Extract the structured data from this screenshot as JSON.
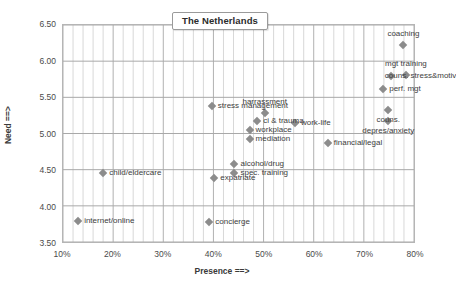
{
  "chart_data": {
    "type": "scatter",
    "title": "The Netherlands",
    "xlabel": "Presence ==>",
    "ylabel": "Need ==>",
    "xlim": [
      10,
      80
    ],
    "ylim": [
      3.5,
      6.5
    ],
    "xticks": [
      "10%",
      "20%",
      "30%",
      "40%",
      "50%",
      "60%",
      "70%",
      "80%"
    ],
    "xtick_values": [
      10,
      20,
      30,
      40,
      50,
      60,
      70,
      80
    ],
    "yticks": [
      "3.50",
      "4.00",
      "4.50",
      "5.00",
      "5.50",
      "6.00",
      "6.50"
    ],
    "ytick_values": [
      3.5,
      4.0,
      4.5,
      5.0,
      5.5,
      6.0,
      6.5
    ],
    "grid": true,
    "legend": "none",
    "marker": "diamond",
    "marker_color": "#8c8c8c",
    "points": [
      {
        "label": "coaching",
        "x": 77.5,
        "y": 6.23,
        "pos": "above"
      },
      {
        "label": "mgt training",
        "x": 78.0,
        "y": 5.82,
        "pos": "above"
      },
      {
        "label": "couns. stress&motiv",
        "x": 75.0,
        "y": 5.8,
        "pos": "left"
      },
      {
        "label": "perf. mgt",
        "x": 73.5,
        "y": 5.62,
        "pos": "right"
      },
      {
        "label": "couns.",
        "x": 74.5,
        "y": 5.33,
        "pos": "below"
      },
      {
        "label": "depres/anxiety",
        "x": 74.5,
        "y": 5.18,
        "pos": "below"
      },
      {
        "label": "harrassment",
        "x": 50.0,
        "y": 5.3,
        "pos": "above"
      },
      {
        "label": "stress management",
        "x": 39.5,
        "y": 5.39,
        "pos": "right"
      },
      {
        "label": "ci & trauma",
        "x": 48.5,
        "y": 5.18,
        "pos": "right"
      },
      {
        "label": "work-life",
        "x": 56.0,
        "y": 5.16,
        "pos": "right"
      },
      {
        "label": "workplace",
        "x": 47.0,
        "y": 5.06,
        "pos": "right"
      },
      {
        "label": "mediation",
        "x": 47.0,
        "y": 4.94,
        "pos": "right"
      },
      {
        "label": "financial/legal",
        "x": 62.5,
        "y": 4.89,
        "pos": "right"
      },
      {
        "label": "alcohol/drug",
        "x": 44.0,
        "y": 4.6,
        "pos": "right"
      },
      {
        "label": "spec. training",
        "x": 44.0,
        "y": 4.47,
        "pos": "right"
      },
      {
        "label": "expatriate",
        "x": 40.0,
        "y": 4.4,
        "pos": "right"
      },
      {
        "label": "child/eldercare",
        "x": 18.0,
        "y": 4.47,
        "pos": "right"
      },
      {
        "label": "internet/online",
        "x": 13.0,
        "y": 3.82,
        "pos": "right"
      },
      {
        "label": "concierge",
        "x": 39.0,
        "y": 3.8,
        "pos": "right"
      }
    ]
  }
}
